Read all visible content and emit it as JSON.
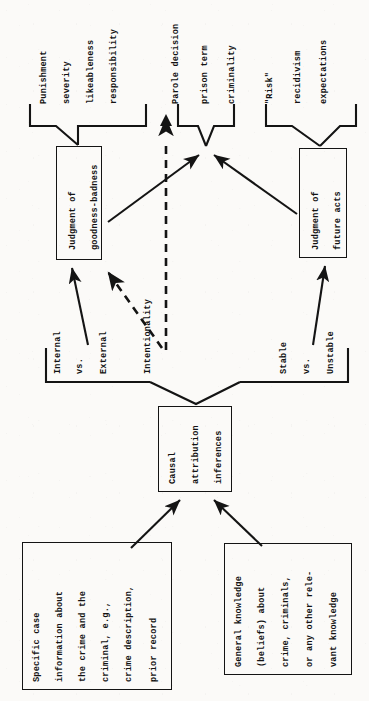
{
  "figure": {
    "type": "flowchart",
    "orientation": "rotated-90-counterclockwise",
    "ink_color": "#141414",
    "paper_color": "#fbfaf8"
  },
  "boxes": {
    "specific_case": {
      "name": "Specific case information box",
      "lines": [
        "Specific case",
        "information about",
        "the crime and the",
        "criminal, e.g.,",
        "crime description,",
        "prior record"
      ]
    },
    "general_knowledge": {
      "name": "General knowledge box",
      "lines": [
        "General knowledge",
        "(beliefs) about",
        "crime, criminals,",
        "or any other rele-",
        "vant knowledge"
      ]
    },
    "causal_attribution": {
      "name": "Causal attribution inferences box",
      "lines": [
        "Causal",
        "attribution",
        "inferences"
      ]
    },
    "goodness_badness": {
      "name": "Judgment of goodness-badness box",
      "lines": [
        "Judgment of",
        "goodness-badness"
      ]
    },
    "future_acts": {
      "name": "Judgment of future acts box",
      "lines": [
        "Judgment of",
        "future acts"
      ]
    }
  },
  "dimension_labels": {
    "internal_external": {
      "name": "Internal vs. External attribution dimension",
      "lines": [
        "Internal",
        "vs.",
        "External"
      ]
    },
    "intentionality": {
      "name": "Intentionality attribution dimension",
      "lines": [
        "Intentionality"
      ]
    },
    "stable_unstable": {
      "name": "Stable vs. Unstable attribution dimension",
      "lines": [
        "Stable",
        "vs.",
        "Unstable"
      ]
    }
  },
  "outcome_groups": {
    "goodness_outcomes": {
      "name": "Goodness-badness outcome measures",
      "lines": [
        "Punishment",
        "severity",
        "likeableness"
      ]
    },
    "responsibility": {
      "name": "Responsibility outcome measure",
      "lines": [
        "responsibility"
      ]
    },
    "parole_outcomes": {
      "name": "Parole and prison outcome measures",
      "lines": [
        "Parole decision",
        "prison term",
        "criminality"
      ]
    },
    "risk_outcomes": {
      "name": "Risk and recidivism outcome measures",
      "lines": [
        "\"Risk\"",
        "recidivism",
        "expectations"
      ]
    }
  },
  "connectors": [
    {
      "name": "specific-case-to-causal-attribution",
      "style": "solid-arrow"
    },
    {
      "name": "general-knowledge-to-causal-attribution",
      "style": "solid-arrow"
    },
    {
      "name": "causal-attribution-to-dimensions-bracket",
      "style": "bracket"
    },
    {
      "name": "internal-external-to-goodness-badness",
      "style": "solid-arrow"
    },
    {
      "name": "stable-unstable-to-future-acts",
      "style": "solid-arrow"
    },
    {
      "name": "intentionality-to-goodness-badness",
      "style": "dashed-arrow"
    },
    {
      "name": "intentionality-to-responsibility",
      "style": "dashed-arrow"
    },
    {
      "name": "goodness-badness-to-parole-outcomes",
      "style": "solid-arrow"
    },
    {
      "name": "future-acts-to-parole-outcomes",
      "style": "solid-arrow"
    },
    {
      "name": "goodness-badness-to-goodness-outcomes",
      "style": "bracket"
    },
    {
      "name": "future-acts-to-risk-outcomes",
      "style": "bracket"
    }
  ]
}
